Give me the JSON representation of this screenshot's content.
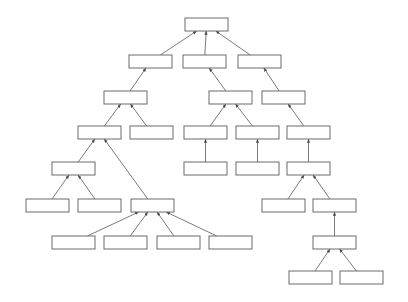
{
  "diagram": {
    "title": "",
    "type": "hierarchical-tree-flow-diagram",
    "canvas": {
      "width": 408,
      "height": 302,
      "background": "#ffffff"
    },
    "style": {
      "box_fill": "#ffffff",
      "box_stroke": "#6b6b6b",
      "edge_stroke": "#6b6b6b",
      "box_width": 43,
      "box_height": 13
    },
    "nodes": [
      {
        "id": "n1",
        "label": "",
        "x": 185,
        "y": 18,
        "level": 1
      },
      {
        "id": "n2",
        "label": "",
        "x": 129,
        "y": 55,
        "level": 2
      },
      {
        "id": "n3",
        "label": "",
        "x": 183,
        "y": 55,
        "level": 2
      },
      {
        "id": "n4",
        "label": "",
        "x": 238,
        "y": 55,
        "level": 2
      },
      {
        "id": "n5",
        "label": "",
        "x": 104,
        "y": 91,
        "level": 3
      },
      {
        "id": "n6",
        "label": "",
        "x": 209,
        "y": 91,
        "level": 3
      },
      {
        "id": "n7",
        "label": "",
        "x": 262,
        "y": 91,
        "level": 3
      },
      {
        "id": "n8",
        "label": "",
        "x": 78,
        "y": 126,
        "level": 4
      },
      {
        "id": "n9",
        "label": "",
        "x": 130,
        "y": 126,
        "level": 4
      },
      {
        "id": "n10",
        "label": "",
        "x": 184,
        "y": 126,
        "level": 4
      },
      {
        "id": "n11",
        "label": "",
        "x": 236,
        "y": 126,
        "level": 4
      },
      {
        "id": "n12",
        "label": "",
        "x": 287,
        "y": 126,
        "level": 4
      },
      {
        "id": "n13",
        "label": "",
        "x": 52,
        "y": 162,
        "level": 5
      },
      {
        "id": "n14",
        "label": "",
        "x": 184,
        "y": 162,
        "level": 5
      },
      {
        "id": "n15",
        "label": "",
        "x": 236,
        "y": 162,
        "level": 5
      },
      {
        "id": "n16",
        "label": "",
        "x": 287,
        "y": 162,
        "level": 5
      },
      {
        "id": "n17",
        "label": "",
        "x": 26,
        "y": 199,
        "level": 6
      },
      {
        "id": "n18",
        "label": "",
        "x": 78,
        "y": 199,
        "level": 6
      },
      {
        "id": "n19",
        "label": "",
        "x": 131,
        "y": 199,
        "level": 6
      },
      {
        "id": "n20",
        "label": "",
        "x": 262,
        "y": 199,
        "level": 6
      },
      {
        "id": "n21",
        "label": "",
        "x": 313,
        "y": 199,
        "level": 6
      },
      {
        "id": "n22",
        "label": "",
        "x": 52,
        "y": 236,
        "level": 7
      },
      {
        "id": "n23",
        "label": "",
        "x": 104,
        "y": 236,
        "level": 7
      },
      {
        "id": "n24",
        "label": "",
        "x": 157,
        "y": 236,
        "level": 7
      },
      {
        "id": "n25",
        "label": "",
        "x": 209,
        "y": 236,
        "level": 7
      },
      {
        "id": "n26",
        "label": "",
        "x": 313,
        "y": 236,
        "level": 7
      },
      {
        "id": "n27",
        "label": "",
        "x": 289,
        "y": 271,
        "level": 8
      },
      {
        "id": "n28",
        "label": "",
        "x": 340,
        "y": 271,
        "level": 8
      }
    ],
    "edges": [
      {
        "from": "n2",
        "to": "n1",
        "arrow": true
      },
      {
        "from": "n3",
        "to": "n1",
        "arrow": true
      },
      {
        "from": "n4",
        "to": "n1",
        "arrow": true
      },
      {
        "from": "n5",
        "to": "n2",
        "arrow": true
      },
      {
        "from": "n6",
        "to": "n3",
        "arrow": true
      },
      {
        "from": "n7",
        "to": "n4",
        "arrow": true
      },
      {
        "from": "n8",
        "to": "n5",
        "arrow": true
      },
      {
        "from": "n9",
        "to": "n5",
        "arrow": true
      },
      {
        "from": "n10",
        "to": "n6",
        "arrow": true
      },
      {
        "from": "n11",
        "to": "n6",
        "arrow": true
      },
      {
        "from": "n12",
        "to": "n7",
        "arrow": true
      },
      {
        "from": "n13",
        "to": "n8",
        "arrow": true
      },
      {
        "from": "n19",
        "to": "n8",
        "arrow": true
      },
      {
        "from": "n14",
        "to": "n10",
        "arrow": true
      },
      {
        "from": "n15",
        "to": "n11",
        "arrow": true
      },
      {
        "from": "n16",
        "to": "n12",
        "arrow": true
      },
      {
        "from": "n17",
        "to": "n13",
        "arrow": true
      },
      {
        "from": "n18",
        "to": "n13",
        "arrow": true
      },
      {
        "from": "n20",
        "to": "n16",
        "arrow": true
      },
      {
        "from": "n21",
        "to": "n16",
        "arrow": true
      },
      {
        "from": "n22",
        "to": "n19",
        "arrow": true
      },
      {
        "from": "n23",
        "to": "n19",
        "arrow": true
      },
      {
        "from": "n24",
        "to": "n19",
        "arrow": true
      },
      {
        "from": "n25",
        "to": "n19",
        "arrow": true
      },
      {
        "from": "n26",
        "to": "n21",
        "arrow": true
      },
      {
        "from": "n27",
        "to": "n26",
        "arrow": true
      },
      {
        "from": "n28",
        "to": "n26",
        "arrow": true
      }
    ]
  }
}
